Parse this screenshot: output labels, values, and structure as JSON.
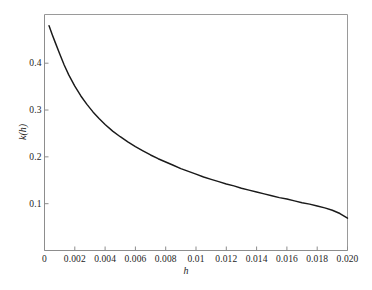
{
  "chart_data": {
    "type": "line",
    "title": "",
    "subtitle": "",
    "xlabel": "h",
    "ylabel": "k(h)",
    "xlim": [
      0,
      0.02
    ],
    "ylim": [
      0,
      0.504
    ],
    "grid": false,
    "legend": null,
    "legend_position": "none",
    "line_color": "#1a1a1a",
    "axis_color": "#8d8d8d",
    "background_color": "#ffffff",
    "x_ticks": [
      0,
      0.002,
      0.004,
      0.006,
      0.008,
      0.01,
      0.012,
      0.014,
      0.016,
      0.018,
      0.02
    ],
    "x_tick_labels": [
      "0",
      "0.002",
      "0.004",
      "0.006",
      "0.008",
      "0.01",
      "0.012",
      "0.014",
      "0.016",
      "0.018",
      "0.020"
    ],
    "y_ticks": [
      0.1,
      0.2,
      0.3,
      0.4
    ],
    "y_tick_labels": [
      "0.1",
      "0.2",
      "0.3",
      "0.4"
    ],
    "series": [
      {
        "name": "k(h)",
        "x": [
          0.0003,
          0.0005,
          0.0007,
          0.001,
          0.0013,
          0.0016,
          0.002,
          0.0024,
          0.0028,
          0.0032,
          0.0036,
          0.004,
          0.0045,
          0.005,
          0.0055,
          0.006,
          0.0065,
          0.007,
          0.0075,
          0.008,
          0.0085,
          0.009,
          0.0095,
          0.01,
          0.0105,
          0.011,
          0.0115,
          0.012,
          0.0125,
          0.013,
          0.0135,
          0.014,
          0.0145,
          0.015,
          0.0155,
          0.016,
          0.0165,
          0.017,
          0.0175,
          0.018,
          0.0185,
          0.019,
          0.0195,
          0.02
        ],
        "y": [
          0.48,
          0.462,
          0.445,
          0.42,
          0.396,
          0.375,
          0.351,
          0.33,
          0.312,
          0.296,
          0.282,
          0.269,
          0.255,
          0.243,
          0.232,
          0.222,
          0.213,
          0.204,
          0.196,
          0.189,
          0.182,
          0.175,
          0.169,
          0.163,
          0.157,
          0.152,
          0.147,
          0.142,
          0.138,
          0.133,
          0.129,
          0.125,
          0.121,
          0.117,
          0.113,
          0.11,
          0.106,
          0.102,
          0.099,
          0.095,
          0.091,
          0.086,
          0.079,
          0.069
        ]
      }
    ],
    "annotations": []
  },
  "axes": {
    "x_title": "h",
    "y_title": "k(h)"
  }
}
